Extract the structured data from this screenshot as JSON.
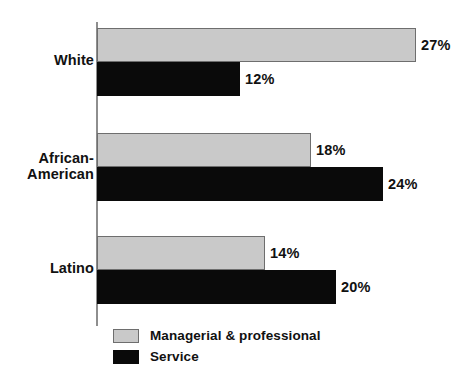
{
  "chart_data": {
    "type": "bar",
    "orientation": "horizontal",
    "title": "",
    "subtitle": "",
    "xlabel": "",
    "ylabel": "",
    "categories": [
      "White",
      "African-\nAmerican",
      "Latino"
    ],
    "series": [
      {
        "name": "Managerial & professional",
        "color": "#c9c9c9",
        "values": [
          27,
          18,
          14
        ],
        "value_labels": [
          "27%",
          "18%",
          "14%"
        ]
      },
      {
        "name": "Service",
        "color": "#0a0a0a",
        "values": [
          12,
          24,
          20
        ],
        "value_labels": [
          "12%",
          "24%",
          "20%"
        ]
      }
    ],
    "xlim": [
      0,
      27
    ],
    "grid": false,
    "legend_position": "bottom-left",
    "axis_color": "#8e8e8e",
    "value_unit": "%"
  },
  "legend": {
    "items": [
      {
        "label": "Managerial & professional",
        "swatch": "managerial"
      },
      {
        "label": "Service",
        "swatch": "service"
      }
    ]
  }
}
